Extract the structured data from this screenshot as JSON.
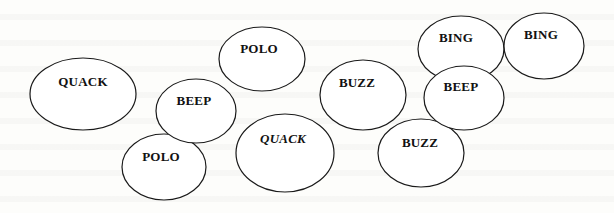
{
  "diagram": {
    "stroke_color": "#1a1a1a",
    "background_color": "#fdfdfb",
    "bubbles": [
      {
        "id": "quack-1",
        "label": "QUACK",
        "italic": false,
        "cx": 83,
        "cy": 94,
        "rx": 53,
        "ry": 36,
        "label_x": 83,
        "label_y": 74
      },
      {
        "id": "polo-1",
        "label": "POLO",
        "italic": false,
        "cx": 262,
        "cy": 59,
        "rx": 43,
        "ry": 32,
        "label_x": 259,
        "label_y": 41
      },
      {
        "id": "beep-1",
        "label": "BEEP",
        "italic": false,
        "cx": 196,
        "cy": 111,
        "rx": 40,
        "ry": 32,
        "label_x": 194,
        "label_y": 93
      },
      {
        "id": "polo-2",
        "label": "POLO",
        "italic": false,
        "cx": 164,
        "cy": 167,
        "rx": 42,
        "ry": 33,
        "label_x": 161,
        "label_y": 149
      },
      {
        "id": "quack-2",
        "label": "QUACK",
        "italic": true,
        "cx": 285,
        "cy": 153,
        "rx": 49,
        "ry": 39,
        "label_x": 283,
        "label_y": 131
      },
      {
        "id": "buzz-1",
        "label": "BUZZ",
        "italic": false,
        "cx": 363,
        "cy": 95,
        "rx": 43,
        "ry": 35,
        "label_x": 357,
        "label_y": 75
      },
      {
        "id": "buzz-2",
        "label": "BUZZ",
        "italic": false,
        "cx": 421,
        "cy": 153,
        "rx": 43,
        "ry": 34,
        "label_x": 420,
        "label_y": 135
      },
      {
        "id": "bing-1",
        "label": "BING",
        "italic": false,
        "cx": 461,
        "cy": 49,
        "rx": 43,
        "ry": 33,
        "label_x": 456,
        "label_y": 30
      },
      {
        "id": "beep-2",
        "label": "BEEP",
        "italic": false,
        "cx": 464,
        "cy": 98,
        "rx": 40,
        "ry": 32,
        "label_x": 461,
        "label_y": 79
      },
      {
        "id": "bing-2",
        "label": "BING",
        "italic": false,
        "cx": 544,
        "cy": 46,
        "rx": 40,
        "ry": 33,
        "label_x": 541,
        "label_y": 27
      }
    ]
  }
}
